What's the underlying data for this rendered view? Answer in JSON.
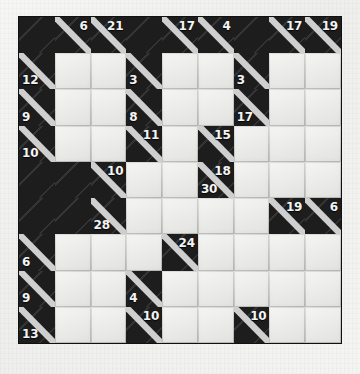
{
  "puzzle": {
    "type": "kakuro",
    "title": "Kakuro",
    "rows": 9,
    "cols": 9,
    "colors": {
      "block": "#1d1d1d",
      "entry": "#e9e9e7",
      "clue_text": "#f4f4f4",
      "grid_line": "#b9b9b5",
      "page_background": "#f2f2f0"
    },
    "icons": {
      "clue_divider": "diagonal-divider-icon"
    },
    "cells": [
      [
        {
          "kind": "block"
        },
        {
          "kind": "clue",
          "down": "6"
        },
        {
          "kind": "clue",
          "down": "21"
        },
        {
          "kind": "block"
        },
        {
          "kind": "clue",
          "down": "17"
        },
        {
          "kind": "clue",
          "down": "4"
        },
        {
          "kind": "block"
        },
        {
          "kind": "clue",
          "down": "17"
        },
        {
          "kind": "clue",
          "down": "19"
        }
      ],
      [
        {
          "kind": "clue",
          "across": "12"
        },
        {
          "kind": "entry",
          "value": ""
        },
        {
          "kind": "entry",
          "value": ""
        },
        {
          "kind": "clue",
          "across": "3"
        },
        {
          "kind": "entry",
          "value": ""
        },
        {
          "kind": "entry",
          "value": ""
        },
        {
          "kind": "clue",
          "across": "3"
        },
        {
          "kind": "entry",
          "value": ""
        },
        {
          "kind": "entry",
          "value": ""
        }
      ],
      [
        {
          "kind": "clue",
          "across": "9"
        },
        {
          "kind": "entry",
          "value": ""
        },
        {
          "kind": "entry",
          "value": ""
        },
        {
          "kind": "clue",
          "across": "8"
        },
        {
          "kind": "entry",
          "value": ""
        },
        {
          "kind": "entry",
          "value": ""
        },
        {
          "kind": "clue",
          "across": "17"
        },
        {
          "kind": "entry",
          "value": ""
        },
        {
          "kind": "entry",
          "value": ""
        }
      ],
      [
        {
          "kind": "clue",
          "across": "10"
        },
        {
          "kind": "entry",
          "value": ""
        },
        {
          "kind": "entry",
          "value": ""
        },
        {
          "kind": "clue",
          "down": "11",
          "tall": true
        },
        {
          "kind": "entry",
          "value": ""
        },
        {
          "kind": "clue",
          "down": "15",
          "tall": true
        },
        {
          "kind": "entry",
          "value": ""
        },
        {
          "kind": "entry",
          "value": ""
        },
        {
          "kind": "entry",
          "value": ""
        }
      ],
      [
        {
          "kind": "block"
        },
        {
          "kind": "block"
        },
        {
          "kind": "clue",
          "down": "10"
        },
        {
          "kind": "entry",
          "value": ""
        },
        {
          "kind": "entry",
          "value": ""
        },
        {
          "kind": "clue",
          "down": "18",
          "across": "30"
        },
        {
          "kind": "entry",
          "value": ""
        },
        {
          "kind": "entry",
          "value": ""
        },
        {
          "kind": "entry",
          "value": ""
        }
      ],
      [
        {
          "kind": "block"
        },
        {
          "kind": "block"
        },
        {
          "kind": "clue",
          "across": "28"
        },
        {
          "kind": "entry",
          "value": ""
        },
        {
          "kind": "entry",
          "value": ""
        },
        {
          "kind": "entry",
          "value": ""
        },
        {
          "kind": "entry",
          "value": ""
        },
        {
          "kind": "clue",
          "down": "19"
        },
        {
          "kind": "clue",
          "down": "6"
        }
      ],
      [
        {
          "kind": "clue",
          "across": "6"
        },
        {
          "kind": "entry",
          "value": ""
        },
        {
          "kind": "entry",
          "value": ""
        },
        {
          "kind": "entry",
          "value": ""
        },
        {
          "kind": "clue",
          "down": "24"
        },
        {
          "kind": "entry",
          "value": ""
        },
        {
          "kind": "entry",
          "value": ""
        },
        {
          "kind": "entry",
          "value": ""
        },
        {
          "kind": "entry",
          "value": ""
        }
      ],
      [
        {
          "kind": "clue",
          "across": "9"
        },
        {
          "kind": "entry",
          "value": ""
        },
        {
          "kind": "entry",
          "value": ""
        },
        {
          "kind": "clue",
          "across": "4"
        },
        {
          "kind": "entry",
          "value": ""
        },
        {
          "kind": "entry",
          "value": ""
        },
        {
          "kind": "entry",
          "value": ""
        },
        {
          "kind": "entry",
          "value": ""
        },
        {
          "kind": "entry",
          "value": ""
        }
      ],
      [
        {
          "kind": "clue",
          "across": "13"
        },
        {
          "kind": "entry",
          "value": ""
        },
        {
          "kind": "entry",
          "value": ""
        },
        {
          "kind": "clue",
          "down": "10"
        },
        {
          "kind": "entry",
          "value": ""
        },
        {
          "kind": "entry",
          "value": ""
        },
        {
          "kind": "clue",
          "down": "10"
        },
        {
          "kind": "entry",
          "value": ""
        },
        {
          "kind": "entry",
          "value": ""
        }
      ],
      [
        {
          "kind": "clue",
          "across": "0"
        },
        {
          "kind": "entry",
          "value": ""
        },
        {
          "kind": "entry",
          "value": ""
        },
        {
          "kind": "clue",
          "across": "3"
        },
        {
          "kind": "entry",
          "value": ""
        },
        {
          "kind": "entry",
          "value": ""
        },
        {
          "kind": "clue",
          "across": "3"
        },
        {
          "kind": "entry",
          "value": ""
        },
        {
          "kind": "entry",
          "value": ""
        }
      ]
    ]
  }
}
